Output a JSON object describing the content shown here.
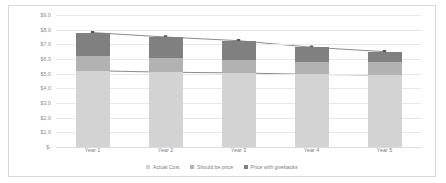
{
  "chart_data": {
    "type": "bar",
    "subtype": "stacked-bar-with-lines",
    "title": "",
    "xlabel": "",
    "ylabel": "",
    "categories": [
      "Year 1",
      "Year 2",
      "Year 3",
      "Year 4",
      "Year 5"
    ],
    "ylim": [
      0,
      9
    ],
    "ytick_values": [
      9,
      8,
      7,
      6,
      5,
      4,
      3,
      2,
      1,
      0
    ],
    "ytick_labels": [
      "$9.0",
      "$8.0",
      "$7.0",
      "$6.0",
      "$5.0",
      "$4.0",
      "$3.0",
      "$2.0",
      "$1.0",
      "$-"
    ],
    "grid": true,
    "legend_position": "bottom",
    "series": [
      {
        "name": "Actual Cost",
        "render": "bar-segment",
        "color": "#d3d3d3",
        "values": [
          5.2,
          5.1,
          5.05,
          4.95,
          4.9
        ]
      },
      {
        "name": "Should be price",
        "render": "bar-segment",
        "color": "#b2b2b2",
        "values": [
          1.0,
          0.95,
          0.9,
          0.85,
          0.9
        ]
      },
      {
        "name": "Price with givebacks",
        "render": "bar-segment",
        "color": "#808080",
        "values": [
          1.6,
          1.45,
          1.3,
          1.0,
          0.7
        ]
      }
    ],
    "line_overlays": [
      {
        "name": "Top of stack",
        "color": "#595959",
        "marker": "square",
        "values": [
          7.8,
          7.5,
          7.25,
          6.8,
          6.5
        ]
      },
      {
        "name": "Actual Cost level",
        "color": "#595959",
        "marker": "square",
        "values": [
          5.2,
          5.1,
          5.05,
          4.95,
          4.9
        ]
      }
    ],
    "totals": [
      7.8,
      7.5,
      7.25,
      6.8,
      6.5
    ]
  },
  "legend": {
    "items": [
      {
        "label": "Actual Cost",
        "color": "#d3d3d3"
      },
      {
        "label": "Should be price",
        "color": "#b2b2b2"
      },
      {
        "label": "Price with givebacks",
        "color": "#808080"
      }
    ]
  }
}
